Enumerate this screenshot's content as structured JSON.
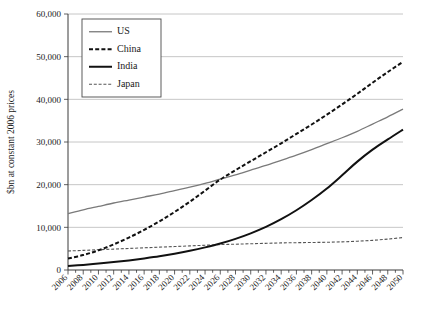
{
  "chart_data": {
    "type": "line",
    "title": "",
    "xlabel": "",
    "ylabel": "$bn at constant 2006 prices",
    "ylim": [
      0,
      60000
    ],
    "xlim": [
      2006,
      2050
    ],
    "grid": true,
    "legend_position": "top-left",
    "y_ticks": [
      "0",
      "10,000",
      "20,000",
      "30,000",
      "40,000",
      "50,000",
      "60,000"
    ],
    "y_tick_values": [
      0,
      10000,
      20000,
      30000,
      40000,
      50000,
      60000
    ],
    "x_tick_labels": [
      "2006",
      "2008",
      "2010",
      "2012",
      "2014",
      "2016",
      "2018",
      "2020",
      "2022",
      "2024",
      "2026",
      "2028",
      "2030",
      "2032",
      "2034",
      "2036",
      "2038",
      "2040",
      "2042",
      "2044",
      "2046",
      "2048",
      "2050"
    ],
    "x": [
      2006,
      2008,
      2010,
      2012,
      2014,
      2016,
      2018,
      2020,
      2022,
      2024,
      2026,
      2028,
      2030,
      2032,
      2034,
      2036,
      2038,
      2040,
      2042,
      2044,
      2046,
      2048,
      2050
    ],
    "series": [
      {
        "name": "US",
        "style": "solid-gray",
        "color": "#7a7a7a",
        "values": [
          13200,
          14100,
          14900,
          15700,
          16400,
          17100,
          17800,
          18600,
          19400,
          20300,
          21300,
          22300,
          23400,
          24500,
          25700,
          26900,
          28200,
          29600,
          31000,
          32500,
          34200,
          35900,
          37700
        ]
      },
      {
        "name": "China",
        "style": "dashed-bold-black",
        "color": "#111111",
        "values": [
          2700,
          3500,
          4600,
          6000,
          7600,
          9400,
          11400,
          13600,
          16000,
          18600,
          21200,
          23400,
          25500,
          27600,
          29700,
          31900,
          34100,
          36400,
          38800,
          41300,
          43900,
          46400,
          48800
        ]
      },
      {
        "name": "India",
        "style": "solid-bold-black",
        "color": "#111111",
        "values": [
          950,
          1200,
          1500,
          1850,
          2250,
          2700,
          3200,
          3800,
          4500,
          5300,
          6200,
          7300,
          8600,
          10100,
          11900,
          14000,
          16400,
          19100,
          22200,
          25400,
          28200,
          30600,
          32900
        ]
      },
      {
        "name": "Japan",
        "style": "dashed-thin-gray",
        "color": "#555555",
        "values": [
          4450,
          4600,
          4750,
          4900,
          5050,
          5200,
          5350,
          5500,
          5650,
          5800,
          5950,
          6050,
          6150,
          6250,
          6350,
          6400,
          6450,
          6500,
          6600,
          6750,
          6950,
          7250,
          7600
        ]
      }
    ]
  },
  "legend": {
    "items": [
      {
        "label": "US"
      },
      {
        "label": "China"
      },
      {
        "label": "India"
      },
      {
        "label": "Japan"
      }
    ]
  }
}
